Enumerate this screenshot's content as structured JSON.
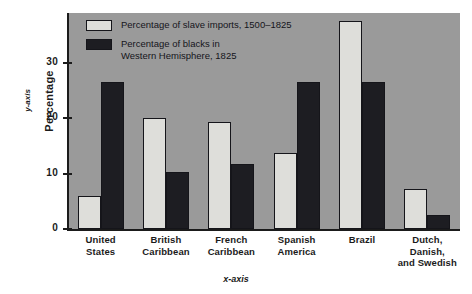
{
  "chart_data": {
    "type": "bar",
    "title": "",
    "xlabel": "x-axis",
    "ylabel": "Percentage",
    "y_axis_tag": "y-axis",
    "x_axis_tag": "x-axis",
    "categories": [
      "United\nStates",
      "British\nCaribbean",
      "French\nCaribbean",
      "Spanish\nAmerica",
      "Brazil",
      "Dutch, Danish,\nand Swedish"
    ],
    "category_lines": [
      [
        "United",
        "States"
      ],
      [
        "British",
        "Caribbean"
      ],
      [
        "French",
        "Caribbean"
      ],
      [
        "Spanish",
        "America"
      ],
      [
        "Brazil",
        ""
      ],
      [
        "Dutch, Danish,",
        "and Swedish"
      ]
    ],
    "series": [
      {
        "name": "Percentage of slave imports, 1500–1825",
        "color": "#dededa",
        "values": [
          6,
          20,
          19.3,
          13.7,
          37.5,
          7.3
        ]
      },
      {
        "name": "Percentage of blacks in\nWestern Hemisphere, 1825",
        "color": "#1d1d22",
        "values": [
          26.5,
          10.3,
          11.8,
          26.5,
          26.5,
          2.5
        ]
      }
    ],
    "ylim": [
      0,
      39
    ],
    "yticks": [
      0,
      10,
      20,
      30
    ],
    "ytick_labels": [
      "0",
      "10",
      "20",
      "30"
    ],
    "grid": false,
    "legend_position": "top-left",
    "plot_background": "#9a9a9a"
  },
  "legend": {
    "items": [
      {
        "label": "Percentage of slave imports, 1500–1825",
        "swatch": "light"
      },
      {
        "label": "Percentage of blacks in\nWestern Hemisphere, 1825",
        "swatch": "dark"
      }
    ]
  }
}
